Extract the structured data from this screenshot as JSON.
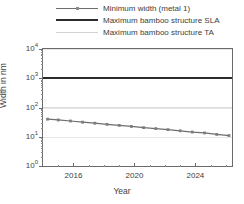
{
  "chart_data": {
    "type": "line",
    "title": "",
    "xlabel": "Year",
    "ylabel": "Width in nm",
    "xlim": [
      2014,
      2026.4
    ],
    "ylim": [
      1,
      10000
    ],
    "yscale": "log",
    "xscale": "linear",
    "grid": true,
    "legend_position": "top",
    "xticks": [
      2016,
      2020,
      2024
    ],
    "xtick_labels": [
      "2016",
      "2020",
      "2024"
    ],
    "xticks_minor": [
      2015,
      2017,
      2018,
      2019,
      2021,
      2022,
      2023,
      2025,
      2026
    ],
    "yticks": [
      1,
      10,
      100,
      1000,
      10000
    ],
    "ytick_labels": [
      "10⁰",
      "10¹",
      "10²",
      "10³",
      "10⁴"
    ],
    "ytick_mantissas": [
      "10",
      "10",
      "10",
      "10",
      "10"
    ],
    "ytick_exponents": [
      "0",
      "1",
      "2",
      "3",
      "4"
    ],
    "series": [
      {
        "name": "Minimum width (metal 1)",
        "style": "line-marker",
        "color": "#6e6e6e",
        "marker": "square",
        "x": [
          2014.3,
          2015.0,
          2015.8,
          2016.6,
          2017.4,
          2018.2,
          2019.0,
          2019.8,
          2020.6,
          2021.4,
          2022.2,
          2023.0,
          2023.8,
          2024.6,
          2025.4,
          2026.2
        ],
        "values": [
          40.0,
          37.5,
          34.5,
          31.5,
          29.0,
          26.5,
          24.5,
          22.5,
          20.5,
          19.0,
          17.5,
          16.0,
          14.5,
          13.5,
          12.0,
          11.0
        ]
      },
      {
        "name": "Maximum bamboo structure SLA",
        "style": "line",
        "color": "#2b2b2b",
        "constant_value": 1000,
        "x": [
          2014,
          2026.4
        ],
        "values": [
          1000,
          1000
        ]
      },
      {
        "name": "Maximum bamboo structure TA",
        "style": "line",
        "color": "#dcdcdc",
        "constant_value": 100,
        "x": [
          2014,
          2026.4
        ],
        "values": [
          100,
          100
        ]
      }
    ]
  },
  "legend": {
    "items": [
      {
        "label": "Minimum width (metal 1)",
        "swatch": "line-with-marker"
      },
      {
        "label": "Maximum bamboo structure SLA",
        "swatch": "thick-dark-line"
      },
      {
        "label": "Maximum bamboo structure TA",
        "swatch": "light-gray-line"
      }
    ]
  },
  "axes": {
    "y_title": "Width in nm",
    "x_title": "Year"
  }
}
